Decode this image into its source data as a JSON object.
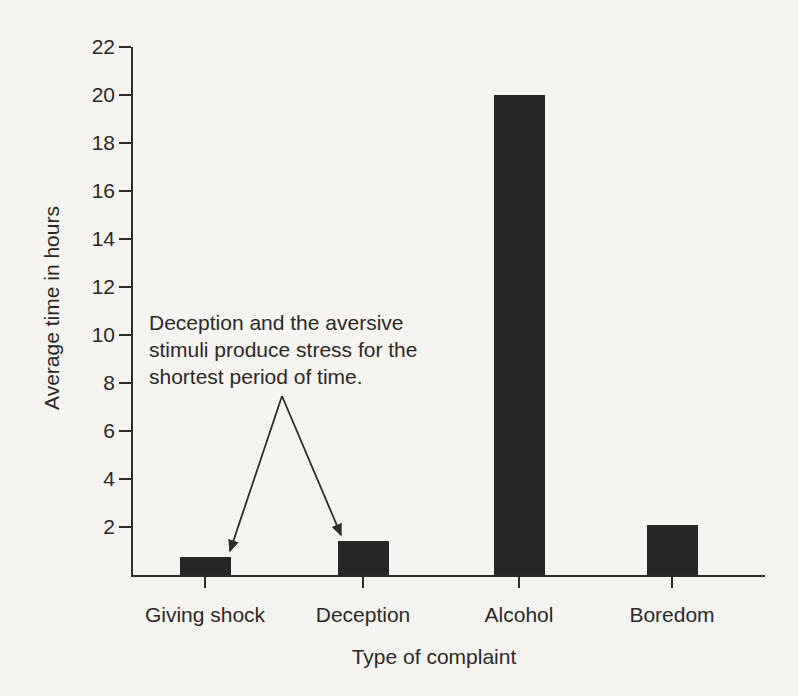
{
  "figure": {
    "paper_color": "#f5f4f0",
    "ink_color": "#2e2c29"
  },
  "chart_data": {
    "type": "bar",
    "title": "",
    "xlabel": "Type of complaint",
    "ylabel": "Average time in hours",
    "categories": [
      "Giving shock",
      "Deception",
      "Alcohol",
      "Boredom"
    ],
    "values": [
      0.75,
      1.4,
      20,
      2.1
    ],
    "yticks": [
      2,
      4,
      6,
      8,
      10,
      12,
      14,
      16,
      18,
      20,
      22
    ],
    "ylim": [
      0,
      22
    ],
    "bar_color": "#282624",
    "grid": false,
    "legend": null,
    "annotation": {
      "text": "Deception and the aversive\nstimuli produce stress for the\nshortest period of time.",
      "targets": [
        "Giving shock",
        "Deception"
      ]
    }
  }
}
